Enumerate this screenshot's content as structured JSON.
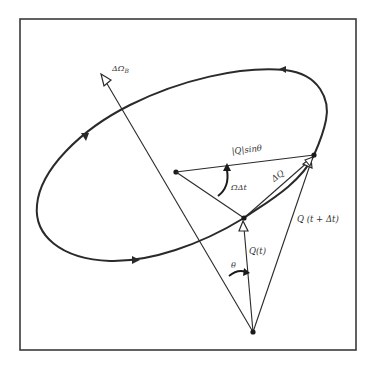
{
  "diagram": {
    "type": "vector-precession",
    "colors": {
      "stroke": "#2a2a2a",
      "frame": "#3a3a3a",
      "text": "#333333",
      "background": "#ffffff"
    },
    "labels": {
      "axis": "ΔΩ",
      "axis_sub": "B",
      "q_sin_theta": "|Q|sinθ",
      "omega_dt": "ΩΔt",
      "delta_q": "ΔQ",
      "q_t": "Q(t)",
      "q_t_dt": "Q (t + Δt)",
      "theta": "θ"
    },
    "points": {
      "origin": [
        253,
        332
      ],
      "center": [
        176,
        172
      ],
      "q_t_tip": [
        244,
        218
      ],
      "q_t_dt_tip": [
        314,
        155
      ],
      "axis_tip": [
        103,
        76
      ]
    }
  }
}
